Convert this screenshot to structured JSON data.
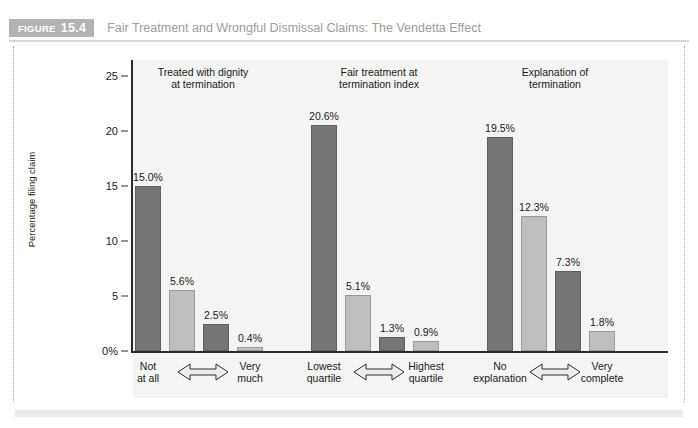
{
  "figure": {
    "tag_word": "FIGURE",
    "tag_number": "15.4",
    "title": "Fair Treatment and Wrongful Dismissal Claims: The Vendetta Effect"
  },
  "colors": {
    "tag_background": "#b3b3b3",
    "title_text": "#9d9d9d",
    "plot_background": "#f4f4f4",
    "bar_dark": "#767676",
    "bar_light": "#bfbfbf",
    "axis": "#2b2b2b"
  },
  "chart_data": {
    "type": "bar",
    "title": "Fair Treatment and Wrongful Dismissal Claims: The Vendetta Effect",
    "xlabel": "",
    "ylabel": "Percentage filing claim",
    "ylim": [
      0,
      26.5
    ],
    "yticks": [
      0,
      5,
      10,
      15,
      20,
      25
    ],
    "ytick_labels": [
      "0%",
      "5",
      "10",
      "15",
      "20",
      "25"
    ],
    "grid": false,
    "legend": "none",
    "groups": [
      {
        "title_line1": "Treated with dignity",
        "title_line2": "at termination",
        "axis_left_line1": "Not",
        "axis_left_line2": "at all",
        "axis_right_line1": "Very",
        "axis_right_line2": "much",
        "axis_arrow": "double-headed-arrow",
        "values": [
          15.0,
          5.6,
          2.5,
          0.4
        ],
        "value_labels": [
          "15.0%",
          "5.6%",
          "2.5%",
          "0.4%"
        ],
        "shades": [
          "dark",
          "light",
          "dark",
          "light"
        ]
      },
      {
        "title_line1": "Fair treatment at",
        "title_line2": "termination index",
        "axis_left_line1": "Lowest",
        "axis_left_line2": "quartile",
        "axis_right_line1": "Highest",
        "axis_right_line2": "quartile",
        "axis_arrow": "double-headed-arrow",
        "values": [
          20.6,
          5.1,
          1.3,
          0.9
        ],
        "value_labels": [
          "20.6%",
          "5.1%",
          "1.3%",
          "0.9%"
        ],
        "shades": [
          "dark",
          "light",
          "dark",
          "light"
        ]
      },
      {
        "title_line1": "Explanation of",
        "title_line2": "termination",
        "axis_left_line1": "No",
        "axis_left_line2": "explanation",
        "axis_right_line1": "Very",
        "axis_right_line2": "complete",
        "axis_arrow": "double-headed-arrow",
        "values": [
          19.5,
          12.3,
          7.3,
          1.8
        ],
        "value_labels": [
          "19.5%",
          "12.3%",
          "7.3%",
          "1.8%"
        ],
        "shades": [
          "dark",
          "light",
          "dark",
          "light"
        ]
      }
    ]
  }
}
